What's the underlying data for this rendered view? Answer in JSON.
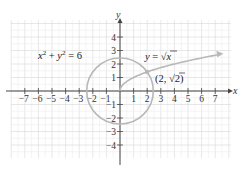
{
  "chart_data": {
    "type": "line",
    "title": "",
    "xlabel": "x",
    "ylabel": "y",
    "xlim": [
      -8,
      8
    ],
    "ylim": [
      -5,
      5
    ],
    "grid": true,
    "x_ticks": [
      -7,
      -6,
      -5,
      -4,
      -3,
      -2,
      -1,
      1,
      2,
      3,
      4,
      5,
      6,
      7
    ],
    "y_ticks": [
      -4,
      -3,
      -2,
      -1,
      1,
      2,
      3,
      4
    ],
    "x_tick_labels": [
      "−7",
      "−6",
      "−5",
      "−4",
      "−3",
      "−2",
      "−1",
      "1",
      "2",
      "3",
      "4",
      "5",
      "6",
      "7"
    ],
    "y_tick_labels": [
      "4",
      "3",
      "2",
      "1",
      "−1",
      "−2",
      "−3",
      "−4"
    ],
    "series": [
      {
        "name": "x^2 + y^2 = 6",
        "kind": "circle",
        "center": [
          0,
          0
        ],
        "radius": 2.449
      },
      {
        "name": "y = sqrt(x)",
        "kind": "curve",
        "x": [
          0,
          0.25,
          1,
          2,
          3,
          4,
          5,
          6,
          7,
          7.5
        ],
        "y": [
          0,
          0.5,
          1,
          1.414,
          1.732,
          2,
          2.236,
          2.449,
          2.646,
          2.739
        ],
        "arrow_end": true
      }
    ],
    "annotations": [
      {
        "text": "x² + y² = 6",
        "x": -4.5,
        "y": 2.4
      },
      {
        "text": "y = √x",
        "x": 3.7,
        "y": 2.4
      },
      {
        "text": "(2, √2)",
        "x": 2.9,
        "y": 0.9,
        "point": [
          2,
          1.414
        ]
      }
    ],
    "color": "#b8b8b8"
  },
  "labels": {
    "x_axis": "x",
    "y_axis": "y",
    "circle_eq_base_x": "x",
    "circle_eq_sup": "2",
    "circle_eq_plus": " + ",
    "circle_eq_base_y": "y",
    "circle_eq_rhs": " = 6",
    "sqrt_eq_y": "y",
    "sqrt_eq_equals": " = ",
    "sqrt_eq_x": "x",
    "point_open": "(2, ",
    "point_root": "2",
    "point_close": ")"
  }
}
